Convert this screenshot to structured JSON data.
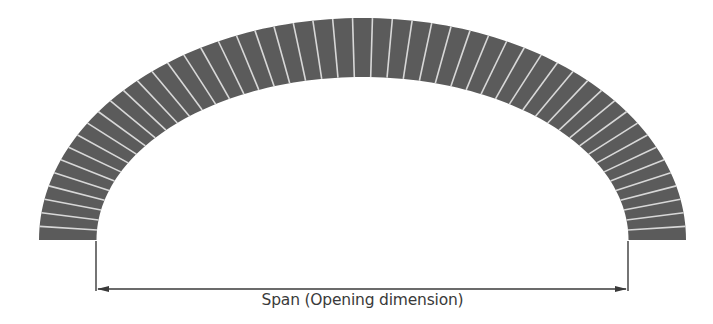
{
  "diagram": {
    "type": "segmental-elliptical-brick-arch",
    "colors": {
      "brick": "#5b5b5b",
      "joint": "#d8d8d8",
      "dimension_line": "#3a3a3a",
      "background": "#ffffff"
    },
    "arch": {
      "center_x": 362.5,
      "spring_y": 240,
      "outer_rx": 323.5,
      "outer_ry": 222,
      "inner_rx": 266,
      "inner_ry": 163,
      "voussoir_count": 51
    },
    "dimension": {
      "label": "Span (Opening dimension)",
      "x1": 96,
      "x2": 628,
      "y": 289,
      "extension_top": 241
    }
  }
}
